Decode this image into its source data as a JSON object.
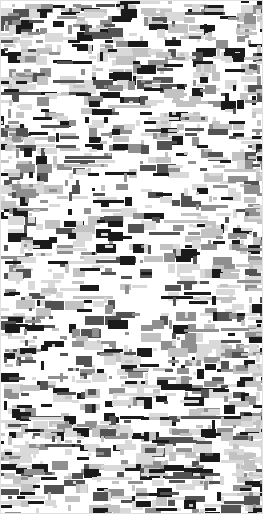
{
  "image": {
    "kind": "abstract-block-noise-texture",
    "width": 263,
    "height": 514,
    "background_color": "#ffffff",
    "border_color": "#e2e2e2",
    "border_width": 1,
    "description": "Dense field of small grayscale rectangles on a white ground, resembling a heavily degraded binarized document scan."
  },
  "palette": {
    "background": "#ffffff",
    "tone_lightest": "#d9d9d9",
    "tone_light": "#c2c2c2",
    "tone_mid": "#8f8f8f",
    "tone_dark": "#525252",
    "tone_darkest": "#1a1a1a"
  },
  "noise": {
    "seed": 20240517,
    "cell_size": 4,
    "columns": 66,
    "rows": 129,
    "fill_probability": 0.175,
    "tone_weights": [
      0.3,
      0.2,
      0.17,
      0.13,
      0.2
    ],
    "tone_colors": [
      "#d9d9d9",
      "#c2c2c2",
      "#8f8f8f",
      "#525252",
      "#1a1a1a"
    ],
    "min_block_w": 1,
    "max_block_w": 5,
    "min_block_h": 1,
    "max_block_h": 3,
    "streak_probability": 0.1,
    "streak_max_w": 11,
    "edge_density_boost": 0.16,
    "edge_band_cols": 7,
    "center_density_falloff": 0.06
  },
  "labels": {
    "canvas_name": "noise-field"
  }
}
